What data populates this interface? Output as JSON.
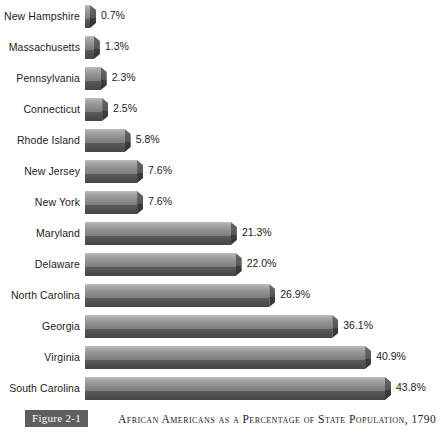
{
  "chart_data": {
    "type": "bar",
    "orientation": "horizontal",
    "title": "African Americans as a Percentage of State Population, 1790",
    "figure_number": "Figure 2-1",
    "xlabel": "",
    "ylabel": "",
    "xlim": [
      0,
      43.8
    ],
    "grid": false,
    "legend": "none",
    "unit": "%",
    "categories": [
      "New Hampshire",
      "Massachusetts",
      "Pennsylvania",
      "Connecticut",
      "Rhode Island",
      "New Jersey",
      "New York",
      "Maryland",
      "Delaware",
      "North Carolina",
      "Georgia",
      "Virginia",
      "South Carolina"
    ],
    "values": [
      0.7,
      1.3,
      2.3,
      2.5,
      5.8,
      7.6,
      7.6,
      21.3,
      22.0,
      26.9,
      36.1,
      40.9,
      43.8
    ],
    "value_labels": [
      "0.7%",
      "1.3%",
      "2.3%",
      "2.5%",
      "5.8%",
      "7.6%",
      "7.6%",
      "21.3%",
      "22.0%",
      "26.9%",
      "36.1%",
      "40.9%",
      "43.8%"
    ]
  },
  "colors": {
    "bar_light": "#bdbdbd",
    "bar_mid": "#7d7d7d",
    "bar_dark": "#464646",
    "badge_bg": "#5e5e5e",
    "text": "#1b1b1b",
    "background": "#ffffff"
  },
  "caption": {
    "badge": "Figure 2-1",
    "title": "African Americans as a Percentage of State Population, 1790"
  }
}
